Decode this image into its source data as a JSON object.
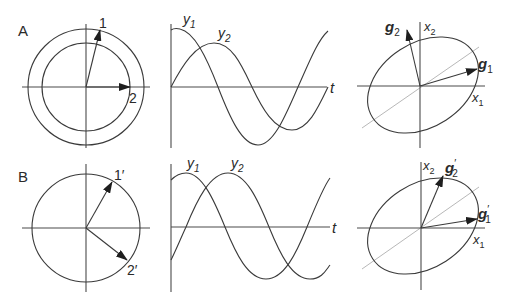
{
  "panels": {
    "A": {
      "label": "A",
      "phasor": {
        "vec1_label": "1",
        "vec2_label": "2"
      },
      "waveform": {
        "y1_label": "y",
        "y1_sub": "1",
        "y2_label": "y",
        "y2_sub": "2",
        "t_label": "t"
      },
      "ellipse": {
        "x1_label": "x",
        "x1_sub": "1",
        "x2_label": "x",
        "x2_sub": "2",
        "g1_label": "g",
        "g1_sub": "1",
        "g2_label": "g",
        "g2_sub": "2"
      }
    },
    "B": {
      "label": "B",
      "phasor": {
        "vec1_label": "1′",
        "vec2_label": "2′"
      },
      "waveform": {
        "y1_label": "y",
        "y1_sub": "1",
        "y2_label": "y",
        "y2_sub": "2",
        "t_label": "t"
      },
      "ellipse": {
        "x1_label": "x",
        "x1_sub": "1",
        "x2_label": "x",
        "x2_sub": "2",
        "g1_label": "g",
        "g1_sub": "1",
        "g1_prime": "′",
        "g2_label": "g",
        "g2_sub": "2",
        "g2_prime": "′"
      }
    }
  },
  "colors": {
    "line": "#3a3a3a",
    "guide": "#b8b8b8",
    "background": "#ffffff"
  }
}
